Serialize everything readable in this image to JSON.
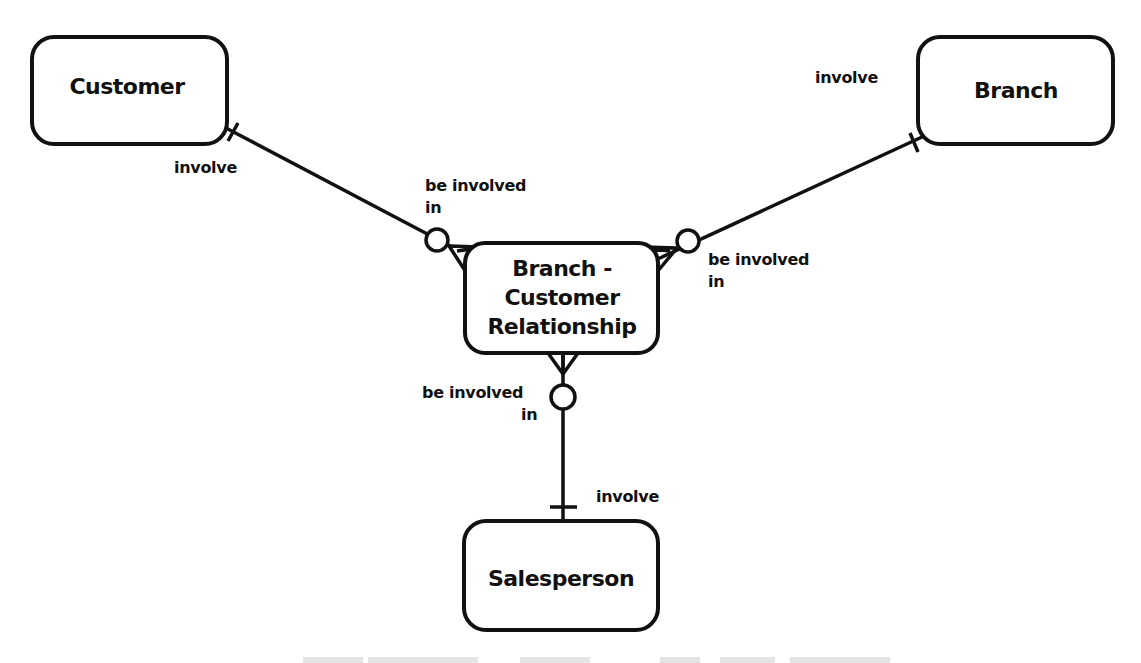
{
  "diagram": {
    "type": "entity-relationship",
    "entities": [
      {
        "id": "customer",
        "label": "Customer"
      },
      {
        "id": "branch",
        "label": "Branch"
      },
      {
        "id": "bcr",
        "label_lines": [
          "Branch -",
          "Customer",
          "Relationship"
        ]
      },
      {
        "id": "salesperson",
        "label": "Salesperson"
      }
    ],
    "relationships": [
      {
        "from": "customer",
        "to": "bcr",
        "from_label": "involve",
        "to_label_lines": [
          "be involved",
          "in"
        ],
        "from_cardinality": "one",
        "to_cardinality": "zero-or-many"
      },
      {
        "from": "branch",
        "to": "bcr",
        "from_label": "involve",
        "to_label_lines": [
          "be involved",
          "in"
        ],
        "from_cardinality": "one",
        "to_cardinality": "zero-or-many"
      },
      {
        "from": "salesperson",
        "to": "bcr",
        "from_label": "involve",
        "to_label_lines": [
          "be involved",
          "in"
        ],
        "from_cardinality": "one",
        "to_cardinality": "zero-or-many"
      }
    ]
  },
  "labels": {
    "customer": "Customer",
    "branch": "Branch",
    "bcr_line1": "Branch -",
    "bcr_line2": "Customer",
    "bcr_line3": "Relationship",
    "salesperson": "Salesperson",
    "customer_role": "involve",
    "customer_bcr_role_1": "be involved",
    "customer_bcr_role_2": "in",
    "branch_role": "involve",
    "branch_bcr_role_1": "be involved",
    "branch_bcr_role_2": "in",
    "salesperson_role": "involve",
    "salesperson_bcr_role_1": "be involved",
    "salesperson_bcr_role_2": "in"
  },
  "colors": {
    "ink": "#111111",
    "background": "#ffffff"
  }
}
